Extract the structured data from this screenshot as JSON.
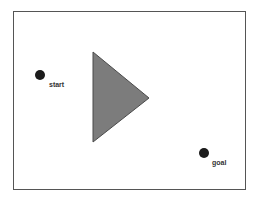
{
  "diagram": {
    "type": "path-planning-scene",
    "frame": {
      "x": 13,
      "y": 11,
      "width": 232,
      "height": 178,
      "stroke": "#555555",
      "fill": "#ffffff"
    },
    "obstacle": {
      "shape": "triangle",
      "points": [
        [
          93,
          52
        ],
        [
          149,
          98
        ],
        [
          93,
          142
        ]
      ],
      "fill": "#7b7b7b",
      "stroke": "#4a4a4a"
    },
    "start": {
      "label": "start",
      "cx": 40,
      "cy": 75,
      "r": 5,
      "fill": "#1a1a1a",
      "label_x": 49,
      "label_y": 87
    },
    "goal": {
      "label": "goal",
      "cx": 204,
      "cy": 153,
      "r": 5,
      "fill": "#1a1a1a",
      "label_x": 212,
      "label_y": 165
    }
  }
}
